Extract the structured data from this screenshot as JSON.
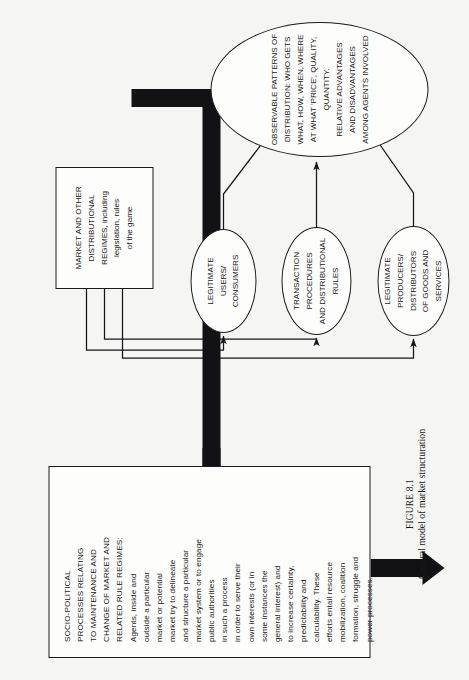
{
  "figure": {
    "number_label": "FIGURE 8.1",
    "caption": "General model of market structuration",
    "orientation": "rotated-90-ccw",
    "background_color": "#f5f5f3",
    "line_color": "#1b1b1d",
    "text_color": "#17171a"
  },
  "nodes": {
    "socio_political": {
      "shape": "rectangle",
      "heading": "SOCIO-POLITICAL\nPROCESSES RELATING\nTO MAINTENANCE AND\nCHANGE OF MARKET AND\nRELATED RULE REGIMES:",
      "body": "Agents, inside and\noutside a particular\nmarket or potential\nmarket try to delineate\nand structure a particular\nmarket system or to engage\npublic authorities\nin such a process\nin order to serve their\nown interests (or in\nsome instances the\ngeneral interest) and\nto increase certainty,\npredictability and\ncalculability. These\nefforts entail resource\nmobilization, coalition\nformation, struggle and\npower processes."
    },
    "market_regimes": {
      "shape": "rectangle",
      "text": "MARKET AND OTHER\nDISTRIBUTIONAL\nREGIMES, including\nlegislation, rules\nof the game"
    },
    "legitimate_users": {
      "shape": "ellipse",
      "text": "LEGITIMATE\nUSERS/\nCONSUMERS"
    },
    "transaction_procedures": {
      "shape": "ellipse",
      "text": "TRANSACTION\nPROCEDURES\nAND DISTRIBUTIONAL\nRULES"
    },
    "legitimate_producers": {
      "shape": "ellipse",
      "text": "LEGITIMATE\nPRODUCERS/\nDISTRIBUTORS\nOF GOODS AND\nSERVICES"
    },
    "observable_patterns": {
      "shape": "ellipse",
      "text": "OBSERVABLE PATTERNS OF\nDISTRIBUTION: WHO GETS\nWHAT, HOW, WHEN, WHERE\nAT WHAT 'PRICE', QUALITY, QUANTITY.\nRELATIVE ADVANTAGES\nAND DISADVANTAGES\nAMONG AGENTS INVOLVED"
    }
  },
  "edges": [
    {
      "name": "socio-to-market",
      "from": "socio_political",
      "to": "market_regimes",
      "style": "thick-block-arrow"
    },
    {
      "name": "market-to-users",
      "from": "market_regimes",
      "to": "legitimate_users",
      "style": "thin-line-arrow"
    },
    {
      "name": "market-to-transaction",
      "from": "market_regimes",
      "to": "transaction_procedures",
      "style": "thin-line-arrow"
    },
    {
      "name": "market-to-producers",
      "from": "market_regimes",
      "to": "legitimate_producers",
      "style": "thin-line-arrow"
    },
    {
      "name": "users-to-observable",
      "from": "legitimate_users",
      "to": "observable_patterns",
      "style": "thin-line-arrow"
    },
    {
      "name": "transaction-to-observable",
      "from": "transaction_procedures",
      "to": "observable_patterns",
      "style": "thin-line-arrow"
    },
    {
      "name": "producers-to-observable",
      "from": "legitimate_producers",
      "to": "observable_patterns",
      "style": "thin-line-arrow"
    },
    {
      "name": "observable-to-socio",
      "from": "observable_patterns",
      "to": "socio_political",
      "style": "thick-block-arrow-feedback"
    }
  ]
}
